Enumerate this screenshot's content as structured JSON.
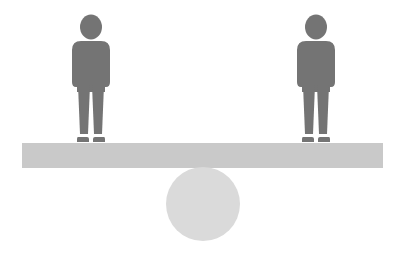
{
  "scene": {
    "description": "Two human figures standing at opposite ends of a balanced seesaw beam resting on a circular fulcrum",
    "colors": {
      "background": "#ffffff",
      "figure": "#747474",
      "beam": "#c9c9c9",
      "fulcrum": "#dadada"
    },
    "figures": [
      {
        "name": "person-left",
        "center_x": 91
      },
      {
        "name": "person-right",
        "center_x": 316
      }
    ],
    "beam": {
      "x": 22,
      "y": 143,
      "width": 361,
      "height": 25
    },
    "fulcrum": {
      "cx": 203,
      "cy": 204,
      "r": 37
    }
  }
}
